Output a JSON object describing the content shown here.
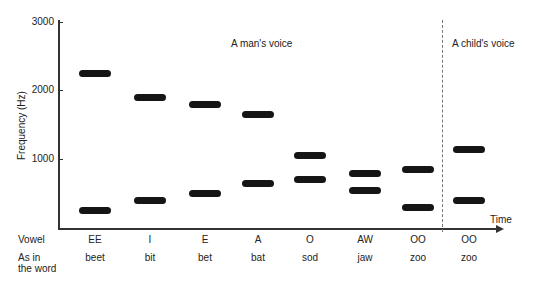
{
  "chart_data": {
    "type": "bar",
    "title": "",
    "xlabel": "Time",
    "ylabel": "Frequency (Hz)",
    "ylim": [
      0,
      3000
    ],
    "yticks": [
      "3000",
      "2000",
      "1000"
    ],
    "grid": false,
    "annotations": [
      "A man's voice",
      "A child's voice"
    ],
    "row_labels": {
      "vowel": "Vowel",
      "word_line1": "As in",
      "word_line2": "the word"
    },
    "categories": [
      "EE",
      "I",
      "E",
      "A",
      "O",
      "AW",
      "OO",
      "OO"
    ],
    "words": [
      "beet",
      "bit",
      "bet",
      "bat",
      "sod",
      "jaw",
      "zoo",
      "zoo"
    ],
    "speaker": [
      "man",
      "man",
      "man",
      "man",
      "man",
      "man",
      "man",
      "child"
    ],
    "series": [
      {
        "name": "Formant 2 (upper)",
        "values": [
          2250,
          1900,
          1800,
          1650,
          1050,
          800,
          850,
          1150
        ]
      },
      {
        "name": "Formant 1 (lower)",
        "values": [
          250,
          400,
          500,
          650,
          700,
          550,
          300,
          400
        ]
      }
    ]
  }
}
